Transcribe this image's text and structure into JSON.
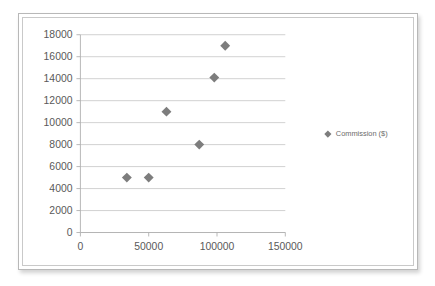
{
  "chart_data": {
    "type": "scatter",
    "title": "",
    "xlabel": "",
    "ylabel": "",
    "xlim": [
      0,
      150000
    ],
    "ylim": [
      0,
      18000
    ],
    "grid": true,
    "grid_axis": "y",
    "legend_position": "right",
    "marker_symbol": "diamond",
    "marker_color": "#7d7d7d",
    "series": [
      {
        "name": "Commission ($)",
        "points": [
          {
            "x": 34000,
            "y": 5000
          },
          {
            "x": 50000,
            "y": 5000
          },
          {
            "x": 63000,
            "y": 11000
          },
          {
            "x": 87000,
            "y": 8000
          },
          {
            "x": 98000,
            "y": 14100
          },
          {
            "x": 106000,
            "y": 17000
          }
        ]
      }
    ],
    "yticks": [
      0,
      2000,
      4000,
      6000,
      8000,
      10000,
      12000,
      14000,
      16000,
      18000
    ],
    "ytick_labels": [
      "0",
      "2000",
      "4000",
      "6000",
      "8000",
      "10000",
      "12000",
      "14000",
      "16000",
      "18000"
    ],
    "xticks": [
      0,
      50000,
      100000,
      150000
    ],
    "xtick_labels": [
      "0",
      "50000",
      "100000",
      "150000"
    ]
  },
  "legend": {
    "entries": [
      {
        "label": "Commission ($)",
        "color": "#7d7d7d",
        "marker": "diamond-marker-icon"
      }
    ]
  },
  "colors": {
    "marker": "#7d7d7d",
    "gridline": "#c6c6c6",
    "axis": "#b0b0b0",
    "tick_text": "#595959",
    "legend_text": "#6b6b6b",
    "frame_outer": "#b8b8b8",
    "frame_inner": "#c9c9c9",
    "background": "#ffffff"
  }
}
